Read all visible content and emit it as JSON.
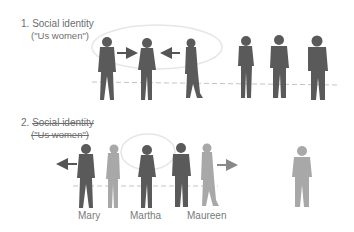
{
  "panel1": {
    "number": "1.",
    "title": "Social identity",
    "subtitle": "(\"Us women\")"
  },
  "panel2": {
    "number": "2.",
    "title": "Social identity",
    "subtitle": "(\"Us women\")",
    "names": [
      "Mary",
      "Martha",
      "Maureen"
    ]
  },
  "colors": {
    "dark_figure": "#5a5a5a",
    "light_figure": "#a8a8a8",
    "ellipse": "#e6e6e6",
    "dashed_line": "#bdbdbd",
    "text": "#6e6e6e"
  }
}
